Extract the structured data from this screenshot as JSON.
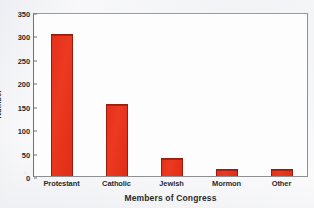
{
  "chart_data": {
    "type": "bar",
    "title": "",
    "subtitle": "",
    "xlabel": "Members of Congress",
    "ylabel": "Number",
    "categories": [
      "Protestant",
      "Catholic",
      "Jewish",
      "Mormon",
      "Other"
    ],
    "values": [
      304,
      154,
      39,
      15,
      15
    ],
    "series": [
      {
        "name": "Number",
        "values": [
          304,
          154,
          39,
          15,
          15
        ]
      }
    ],
    "ylim": [
      0,
      350
    ],
    "ytick_labels": [
      "0",
      "50",
      "100",
      "150",
      "200",
      "250",
      "300",
      "350"
    ],
    "ytick_values": [
      0,
      50,
      100,
      150,
      200,
      250,
      300,
      350
    ],
    "grid": false,
    "legend": "none",
    "bar_color": "#e5301b",
    "bar_border_color": "#9c1c0c",
    "frame_color": "#8d8f93",
    "plot_background": "#fdfdfe",
    "text_color": "#2a2a2c",
    "annotations": []
  }
}
